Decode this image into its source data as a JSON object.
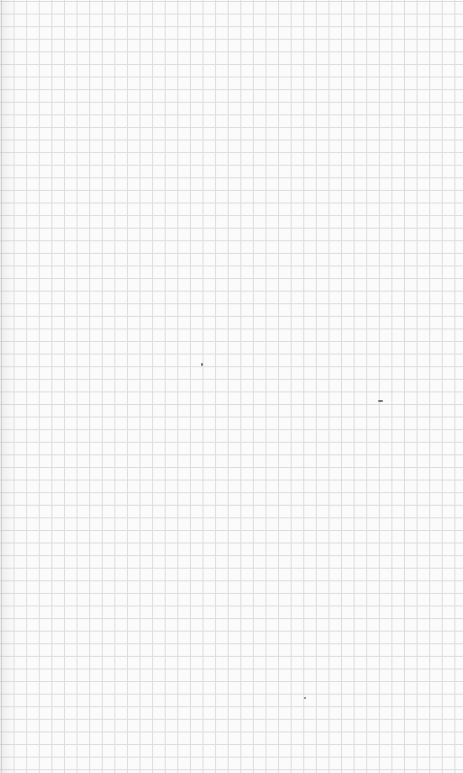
{
  "page": {
    "type": "grid-paper",
    "background_color": "#fbfbfb",
    "grid_line_color": "#dcdcdc",
    "grid_spacing_px": 12.6
  },
  "specks": [
    {
      "x": 201,
      "y": 363,
      "w": 2,
      "h": 3
    },
    {
      "x": 378,
      "y": 400,
      "w": 5,
      "h": 2
    },
    {
      "x": 304,
      "y": 697,
      "w": 2,
      "h": 2
    }
  ]
}
